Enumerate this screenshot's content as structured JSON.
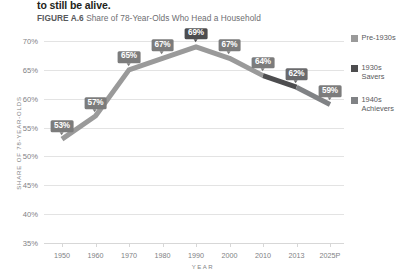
{
  "header": {
    "running_head": "to still be alive.",
    "figure_number": "FIGURE A.6",
    "figure_title": "Share of 78-Year-Olds Who Head a Household"
  },
  "axes": {
    "y_title": "SHARE OF 78-YEAR-OLDS",
    "x_title": "YEAR"
  },
  "legend": {
    "items": [
      {
        "label": "Pre-1930s",
        "color": "#9a9a9a",
        "name": "legend-pre-1930s"
      },
      {
        "label": "1930s\nSavers",
        "line1": "1930s",
        "line2": "Savers",
        "color": "#4d4d4f",
        "name": "legend-1930s-savers"
      },
      {
        "label": "1940s\nAchievers",
        "line1": "1940s",
        "line2": "Achievers",
        "color": "#808285",
        "name": "legend-1940s-achievers"
      }
    ]
  },
  "chart_data": {
    "type": "line",
    "title": "Share of 78-Year-Olds Who Head a Household",
    "xlabel": "YEAR",
    "ylabel": "SHARE OF 78-YEAR-OLDS",
    "grid": true,
    "legend_position": "right",
    "categories": [
      "1950",
      "1960",
      "1970",
      "1980",
      "1990",
      "2000",
      "2010",
      "2013",
      "2025P"
    ],
    "values": [
      53,
      57,
      65,
      67,
      69,
      67,
      64,
      62,
      59
    ],
    "point_labels": [
      "53%",
      "57%",
      "65%",
      "67%",
      "69%",
      "67%",
      "64%",
      "62%",
      "59%"
    ],
    "ylim": [
      35,
      70
    ],
    "yticks": [
      "35%",
      "40%",
      "45%",
      "50%",
      "55%",
      "60%",
      "65%",
      "70%"
    ],
    "ytick_values": [
      35,
      40,
      45,
      50,
      55,
      60,
      65,
      70
    ],
    "xticks": [
      "1950",
      "1960",
      "1970",
      "1980",
      "1990",
      "2000",
      "2010",
      "2013",
      "2025P"
    ],
    "series": [
      {
        "name": "Pre-1930s",
        "color": "#9a9a9a",
        "segment_from": "1950",
        "segment_to": "2010"
      },
      {
        "name": "1930s Savers",
        "color": "#4d4d4f",
        "segment_from": "2010",
        "segment_to": "2013"
      },
      {
        "name": "1940s Achievers",
        "color": "#808285",
        "segment_from": "2013",
        "segment_to": "2025P"
      }
    ]
  }
}
